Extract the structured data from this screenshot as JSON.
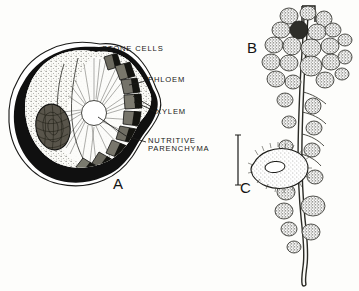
{
  "figure": {
    "background_color": "#fdfdfb",
    "ink_color": "#1a1a18",
    "panels": [
      {
        "letter": "A",
        "name": "fruit-cross-section",
        "description": "Transverse section of fruit showing stone cells, phloem, xylem and nutritive parenchyma"
      },
      {
        "letter": "B",
        "name": "nodulated-branch",
        "description": "Branch bearing clustered nodules"
      },
      {
        "letter": "C",
        "name": "nodule-section",
        "description": "Small oval sectioned nodule with scale bar"
      }
    ],
    "callouts": [
      {
        "id": "stone-cells",
        "text": "STONE CELLS"
      },
      {
        "id": "phloem",
        "text": "PHLOEM"
      },
      {
        "id": "xylem",
        "text": "XYLEM"
      },
      {
        "id": "nutritive-parenchyma",
        "text": "NUTRITIVE\nPARENCHYMA"
      }
    ]
  }
}
